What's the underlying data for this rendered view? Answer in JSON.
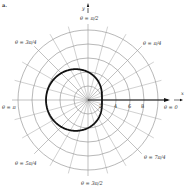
{
  "figure": {
    "marker": "a.",
    "axes": {
      "x_label": "x",
      "y_label": "y"
    },
    "angle_labels": [
      {
        "id": "pi-over-2",
        "text": "θ = π/2",
        "num": "π",
        "den": "2"
      },
      {
        "id": "pi-over-4",
        "text": "θ = π/4",
        "num": "π",
        "den": "4"
      },
      {
        "id": "3pi-over-4",
        "text": "θ = 3π/4",
        "num": "3π",
        "den": "4"
      },
      {
        "id": "pi",
        "text": "θ = π"
      },
      {
        "id": "zero",
        "text": "θ = 0"
      },
      {
        "id": "5pi-over-4",
        "text": "θ = 5π/4",
        "num": "5π",
        "den": "4"
      },
      {
        "id": "7pi-over-4",
        "text": "θ = 7π/4",
        "num": "7π",
        "den": "4"
      },
      {
        "id": "3pi-over-2",
        "text": "θ = 3π/2",
        "num": "3π",
        "den": "2"
      }
    ],
    "radial_ticks": [
      "2",
      "4",
      "6",
      "8"
    ],
    "curve": "r = 4 - 2cos(θ)",
    "grid": {
      "rings": [
        2,
        4,
        6,
        8,
        10
      ],
      "spoke_step_deg": 15
    }
  }
}
